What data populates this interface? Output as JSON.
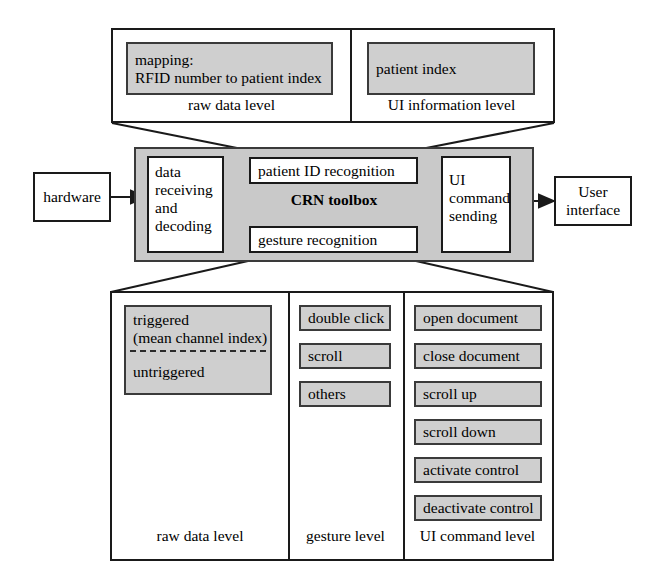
{
  "diagram": {
    "colors": {
      "gray_fill": "#cfcfcf",
      "gray_area": "#c9c9c9",
      "line": "#1a1a1a",
      "background": "#ffffff"
    }
  },
  "top_panel": {
    "columns": [
      {
        "level_label": "raw data level",
        "items": [
          {
            "label": "mapping:\nRFID number to patient index"
          }
        ]
      },
      {
        "level_label": "UI information level",
        "items": [
          {
            "label": "patient index"
          }
        ]
      }
    ]
  },
  "middle": {
    "external_left": {
      "label": "hardware"
    },
    "external_right": {
      "label": "User\ninterface"
    },
    "toolbox_label": "CRN toolbox",
    "blocks": [
      {
        "id": "data-receiving",
        "label": "data\nreceiving\nand\ndecoding"
      },
      {
        "id": "patient-id-recognition",
        "label": "patient ID recognition"
      },
      {
        "id": "gesture-recognition",
        "label": "gesture recognition"
      },
      {
        "id": "ui-command-sending",
        "label": "UI\ncommand\nsending"
      }
    ]
  },
  "bottom_panel": {
    "columns": [
      {
        "level_label": "raw data level",
        "items": [
          {
            "label": "triggered\n(mean channel index)"
          },
          {
            "label": "untriggered"
          }
        ]
      },
      {
        "level_label": "gesture level",
        "items": [
          {
            "label": "double click"
          },
          {
            "label": "scroll"
          },
          {
            "label": "others"
          }
        ]
      },
      {
        "level_label": "UI command level",
        "items": [
          {
            "label": "open document"
          },
          {
            "label": "close document"
          },
          {
            "label": "scroll up"
          },
          {
            "label": "scroll down"
          },
          {
            "label": "activate control"
          },
          {
            "label": "deactivate control"
          }
        ]
      }
    ]
  }
}
